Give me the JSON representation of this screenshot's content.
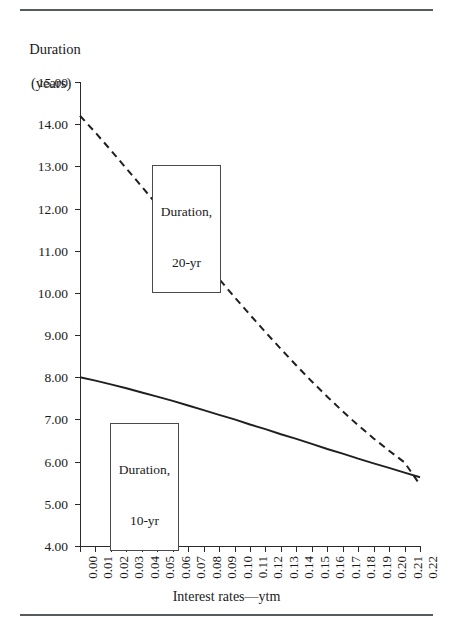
{
  "figure": {
    "y_axis_title_line1": "Duration",
    "y_axis_title_line2": "(years)",
    "x_axis_caption": "Interest rates—ytm"
  },
  "annotations": {
    "twenty_year": {
      "line1": "Duration,",
      "line2": "20-yr"
    },
    "ten_year": {
      "line1": "Duration,",
      "line2": "10-yr"
    }
  },
  "chart_data": {
    "type": "line",
    "title": "",
    "subtitle": "",
    "xlabel": "Interest rates—ytm",
    "ylabel": "Duration (years)",
    "xlim": [
      0.0,
      0.22
    ],
    "ylim": [
      4.0,
      15.0
    ],
    "grid": false,
    "legend_position": "inline-callout-boxes",
    "x_tick_labels": [
      "0.00",
      "0.01",
      "0.02",
      "0.03",
      "0.04",
      "0.05",
      "0.06",
      "0.07",
      "0.08",
      "0.09",
      "0.10",
      "0.11",
      "0.12",
      "0.13",
      "0.14",
      "0.15",
      "0.16",
      "0.17",
      "0.18",
      "0.19",
      "0.20",
      "0.21",
      "0.22"
    ],
    "y_tick_labels": [
      "15.00",
      "14.00",
      "13.00",
      "12.00",
      "11.00",
      "10.00",
      "9.00",
      "8.00",
      "7.00",
      "6.00",
      "5.00",
      "4.00"
    ],
    "x": [
      0.0,
      0.01,
      0.02,
      0.03,
      0.04,
      0.05,
      0.06,
      0.07,
      0.08,
      0.09,
      0.1,
      0.11,
      0.12,
      0.13,
      0.14,
      0.15,
      0.16,
      0.17,
      0.18,
      0.19,
      0.2,
      0.21,
      0.22
    ],
    "series": [
      {
        "name": "Duration, 20-yr",
        "style": "dashed",
        "color": "#1f1f1f",
        "values": [
          14.2,
          13.8,
          13.38,
          12.95,
          12.52,
          12.08,
          11.64,
          11.2,
          10.76,
          10.33,
          9.9,
          9.48,
          9.07,
          8.67,
          8.28,
          7.9,
          7.54,
          7.19,
          6.86,
          6.55,
          6.26,
          5.98,
          5.45
        ]
      },
      {
        "name": "Duration, 10-yr",
        "style": "solid",
        "color": "#1f1f1f",
        "values": [
          8.0,
          7.92,
          7.83,
          7.74,
          7.64,
          7.54,
          7.44,
          7.33,
          7.22,
          7.11,
          7.0,
          6.88,
          6.77,
          6.65,
          6.54,
          6.42,
          6.3,
          6.19,
          6.07,
          5.96,
          5.85,
          5.74,
          5.63
        ]
      }
    ]
  }
}
